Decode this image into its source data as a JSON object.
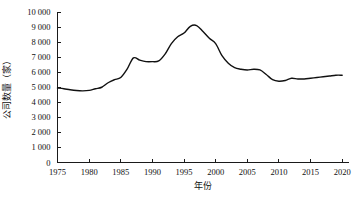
{
  "chart_data": {
    "type": "line",
    "title": "",
    "xlabel": "年份",
    "ylabel": "公司数量（家）",
    "xlim": [
      1975,
      2021
    ],
    "ylim": [
      0,
      10000
    ],
    "grid": false,
    "legend": "none",
    "x_ticks": [
      1975,
      1980,
      1985,
      1990,
      1995,
      2000,
      2005,
      2010,
      2015,
      2020
    ],
    "x_tick_labels": [
      "1975",
      "1980",
      "1985",
      "1990",
      "1995",
      "2000",
      "2005",
      "2010",
      "2015",
      "2020"
    ],
    "y_ticks": [
      0,
      1000,
      2000,
      3000,
      4000,
      5000,
      6000,
      7000,
      8000,
      9000,
      10000
    ],
    "y_tick_labels": [
      "0",
      "1 000",
      "2 000",
      "3 000",
      "4 000",
      "5 000",
      "6 000",
      "7 000",
      "8 000",
      "9 000",
      "10 000"
    ],
    "series": [
      {
        "name": "公司数量（家）",
        "color": "#111111",
        "x": [
          1975,
          1976,
          1977,
          1978,
          1979,
          1980,
          1981,
          1982,
          1983,
          1984,
          1985,
          1986,
          1987,
          1988,
          1989,
          1990,
          1991,
          1992,
          1993,
          1994,
          1995,
          1996,
          1997,
          1998,
          1999,
          2000,
          2001,
          2002,
          2003,
          2004,
          2005,
          2006,
          2007,
          2008,
          2009,
          2010,
          2011,
          2012,
          2013,
          2014,
          2015,
          2016,
          2017,
          2018,
          2019,
          2020
        ],
        "values": [
          4950,
          4900,
          4830,
          4780,
          4760,
          4790,
          4900,
          5000,
          5300,
          5500,
          5650,
          6200,
          6950,
          6800,
          6700,
          6700,
          6750,
          7200,
          7900,
          8350,
          8600,
          9050,
          9100,
          8700,
          8250,
          7900,
          7100,
          6600,
          6300,
          6200,
          6150,
          6200,
          6150,
          5850,
          5500,
          5400,
          5450,
          5600,
          5550,
          5550,
          5600,
          5650,
          5700,
          5750,
          5800,
          5800
        ]
      }
    ]
  },
  "axis": {
    "y_title": "公司数量（家）",
    "x_title": "年份"
  }
}
